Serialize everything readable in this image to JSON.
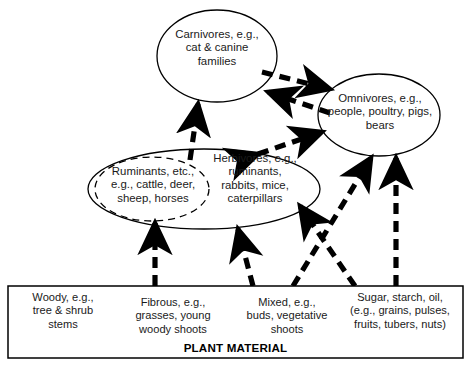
{
  "diagram": {
    "title": "PLANT MATERIAL",
    "nodes": {
      "carnivores": {
        "label": "Carnivores, e.g.,\ncat & canine\nfamilies",
        "shape": "ellipse"
      },
      "omnivores": {
        "label": "Omnivores, e.g.,\npeople, poultry, pigs,\nbears",
        "shape": "ellipse"
      },
      "herbivores": {
        "label": "Herbivores, e.g.,\nruminants,\nrabbits,  mice,\ncaterpillars",
        "shape": "ellipse"
      },
      "ruminants": {
        "label": "Ruminants, etc.,\ne.g., cattle, deer,\nsheep, horses",
        "shape": "dashed-ellipse"
      }
    },
    "plant_material": {
      "box_label": "PLANT MATERIAL",
      "columns": [
        {
          "label": "Woody, e.g.,\ntree & shrub\nstems"
        },
        {
          "label": "Fibrous, e.g.,\ngrasses, young\nwoody shoots"
        },
        {
          "label": "Mixed, e.g.,\nbuds, vegetative\nshoots"
        },
        {
          "label": "Sugar, starch, oil,\n(e.g., grains, pulses,\nfruits, tubers, nuts)"
        }
      ]
    },
    "edges": [
      {
        "name": "carnivores-to-omnivores",
        "from": "carnivores",
        "to": "omnivores",
        "style": "dashed",
        "arrow": "single"
      },
      {
        "name": "omnivores-to-carnivores",
        "from": "omnivores",
        "to": "carnivores",
        "style": "dashed",
        "arrow": "single"
      },
      {
        "name": "herbivores-to-carnivores",
        "from": "herbivores",
        "to": "carnivores",
        "style": "dashed",
        "arrow": "single"
      },
      {
        "name": "herbivores-omnivores",
        "from": "herbivores",
        "to": "omnivores",
        "style": "dashed",
        "arrow": "double"
      },
      {
        "name": "fibrous-to-ruminants",
        "from": "fibrous",
        "to": "ruminants",
        "style": "dashed",
        "arrow": "single"
      },
      {
        "name": "mixed-to-herbivores",
        "from": "mixed",
        "to": "herbivores",
        "style": "dashed",
        "arrow": "single"
      },
      {
        "name": "mixed-to-omnivores",
        "from": "mixed",
        "to": "omnivores",
        "style": "dashed",
        "arrow": "single"
      },
      {
        "name": "sugar-to-herbivores",
        "from": "sugar",
        "to": "herbivores",
        "style": "dashed",
        "arrow": "single"
      },
      {
        "name": "sugar-to-omnivores",
        "from": "sugar",
        "to": "omnivores",
        "style": "dashed",
        "arrow": "single"
      }
    ],
    "colors": {
      "stroke": "#000000",
      "text": "#1a1a1a",
      "background": "#ffffff"
    }
  }
}
